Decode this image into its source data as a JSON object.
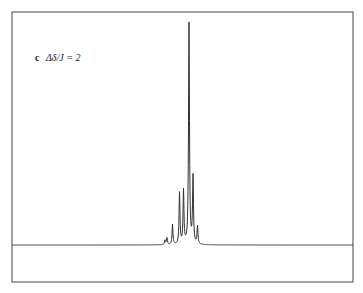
{
  "chart_data": {
    "type": "line",
    "title": "",
    "panel_label": "c",
    "annotation": "Δδ/J = 2",
    "xlabel": "",
    "ylabel": "",
    "grid": false,
    "legend": null,
    "baseline_y": 0,
    "peaks": [
      {
        "x": 165,
        "height": 0.02
      },
      {
        "x": 167,
        "height": 0.03
      },
      {
        "x": 172.5,
        "height": 0.09
      },
      {
        "x": 179.5,
        "height": 0.23
      },
      {
        "x": 183.5,
        "height": 0.24
      },
      {
        "x": 189,
        "height": 1.0
      },
      {
        "x": 193,
        "height": 0.3
      },
      {
        "x": 197.5,
        "height": 0.08
      }
    ],
    "x_range": [
      12,
      353
    ]
  },
  "label": {
    "panel": "c",
    "expr": "Δδ/J = 2"
  },
  "colors": {
    "line": "#333333",
    "frame": "#444444",
    "background": "#ffffff"
  }
}
